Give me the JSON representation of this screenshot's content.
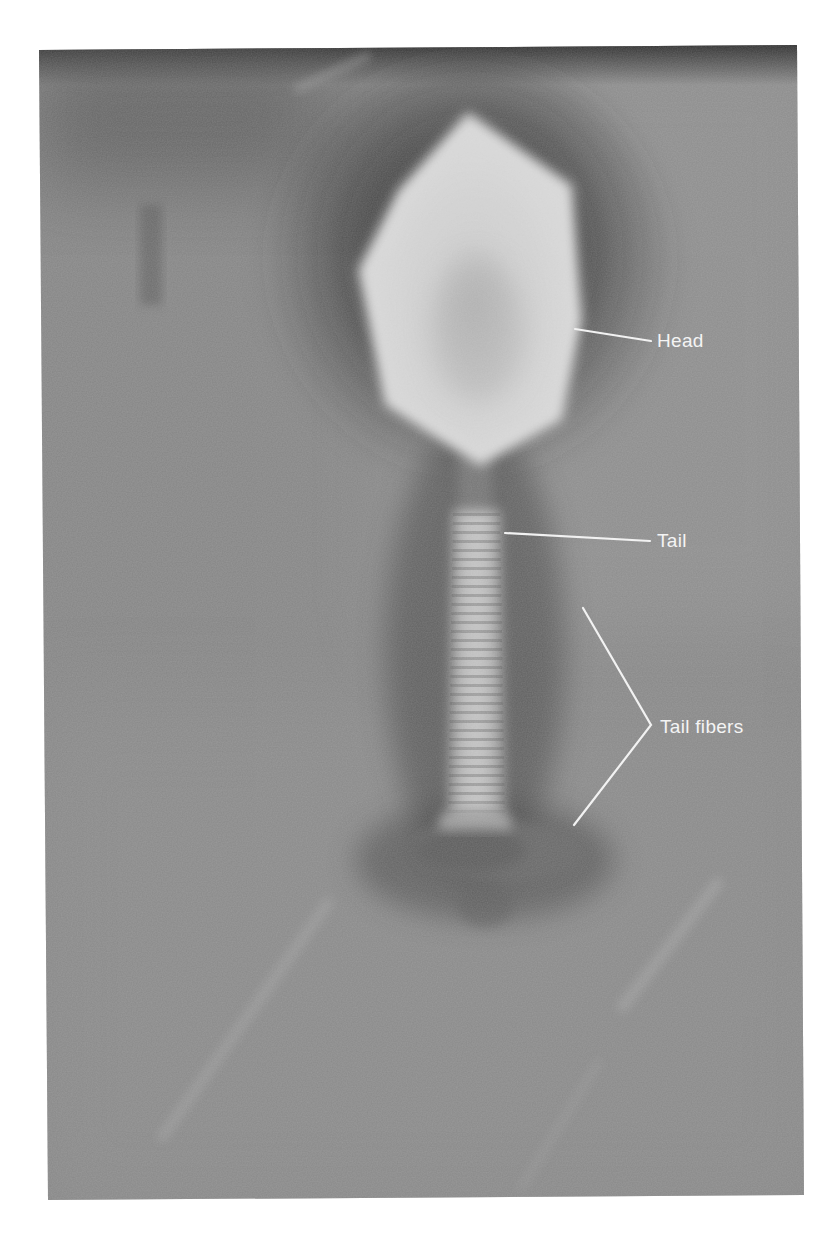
{
  "figure": {
    "style": "grayscale",
    "frame": {
      "top_left": [
        39,
        50
      ],
      "top_right": [
        797,
        45
      ],
      "bottom_right": [
        804,
        1195
      ],
      "bottom_left": [
        48,
        1200
      ]
    },
    "colors": {
      "page_background": "#ffffff",
      "field_gray": "#8e8e8e",
      "halo_dark": "#3a3a3a",
      "head_bright": "#f0f0f0",
      "label_white": "#f4f4f4"
    }
  },
  "labels": [
    {
      "id": "head",
      "text": "Head",
      "text_x": 657,
      "text_y": 347,
      "leader": [
        [
          575,
          329
        ],
        [
          651,
          341
        ]
      ]
    },
    {
      "id": "tail",
      "text": "Tail",
      "text_x": 657,
      "text_y": 547,
      "leader": [
        [
          505,
          533
        ],
        [
          650,
          541
        ]
      ]
    },
    {
      "id": "tail-fibers",
      "text": "Tail fibers",
      "text_x": 660,
      "text_y": 733,
      "leader": [
        [
          583,
          608
        ],
        [
          651,
          725
        ],
        [
          574,
          825
        ]
      ]
    }
  ]
}
